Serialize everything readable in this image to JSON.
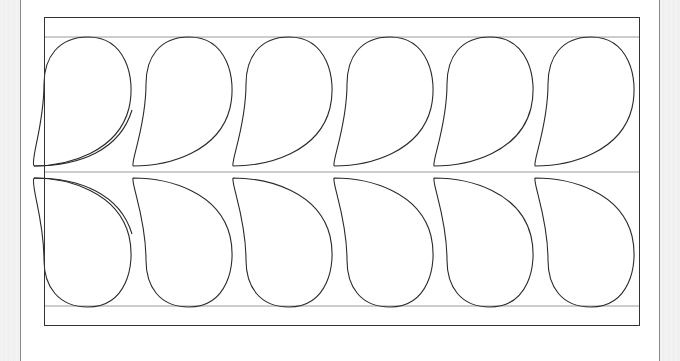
{
  "canvas": {
    "width": 680,
    "height": 361,
    "background": "#ffffff"
  },
  "colors": {
    "stroke": "#2a2a2a",
    "guide": "#9a9a9a",
    "frame": "#333333",
    "side": "#f0f0f0"
  },
  "frame": {
    "x": 44,
    "y": 17,
    "width": 596,
    "height": 309
  },
  "guides": {
    "top_y": 37,
    "middle_y": 172,
    "bottom_y": 306
  },
  "paisley": {
    "rows": [
      {
        "name": "top-row",
        "orientation": "up"
      },
      {
        "name": "bottom-row",
        "orientation": "down"
      }
    ],
    "count_per_row": 6,
    "centers_x": [
      88,
      189,
      289,
      390,
      490,
      591
    ]
  }
}
